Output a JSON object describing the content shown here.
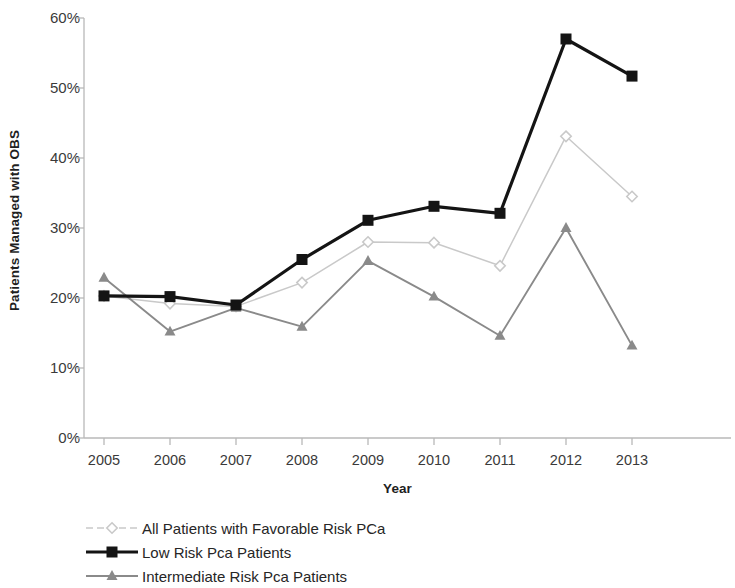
{
  "chart_data": {
    "type": "line",
    "title": "",
    "xlabel": "Year",
    "ylabel": "Patients Managed with OBS",
    "categories": [
      "2005",
      "2006",
      "2007",
      "2008",
      "2009",
      "2010",
      "2011",
      "2012",
      "2013"
    ],
    "x": [
      2005,
      2006,
      2007,
      2008,
      2009,
      2010,
      2011,
      2012,
      2013
    ],
    "ylim": [
      0,
      60
    ],
    "yticks": [
      0,
      10,
      20,
      30,
      40,
      50,
      60
    ],
    "ytick_labels": [
      "0%",
      "10%",
      "20%",
      "30%",
      "40%",
      "50%",
      "60%"
    ],
    "grid": false,
    "legend_position": "bottom-left",
    "series": [
      {
        "name": "All Patients with Favorable Risk PCa",
        "marker": "diamond",
        "color": "#c9c9c9",
        "values": [
          20.3,
          19.2,
          18.8,
          22.2,
          28.0,
          27.9,
          24.6,
          43.1,
          34.5
        ]
      },
      {
        "name": "Low Risk Pca Patients",
        "marker": "square",
        "color": "#141414",
        "values": [
          20.3,
          20.2,
          19.0,
          25.5,
          31.1,
          33.1,
          32.1,
          57.0,
          51.7
        ]
      },
      {
        "name": "Intermediate Risk Pca Patients",
        "marker": "triangle",
        "color": "#8a8a8a",
        "values": [
          22.9,
          15.2,
          18.6,
          15.9,
          25.3,
          20.2,
          14.6,
          30.0,
          13.2
        ]
      }
    ]
  },
  "legend": {
    "items": [
      {
        "label": "All Patients with Favorable Risk PCa",
        "marker": "diamond-marker",
        "color": "#c9c9c9"
      },
      {
        "label": "Low Risk Pca Patients",
        "marker": "square-marker",
        "color": "#141414"
      },
      {
        "label": "Intermediate Risk Pca Patients",
        "marker": "triangle-marker",
        "color": "#8a8a8a"
      }
    ]
  },
  "axes": {
    "y_title": "Patients Managed with OBS",
    "x_title": "Year",
    "axis_color": "#b8b8b8"
  }
}
